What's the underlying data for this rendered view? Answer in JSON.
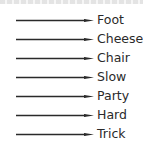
{
  "diagram": {
    "type": "arrow-list",
    "arrow_color": "#2a2a2a",
    "text_color": "#2a2a2a",
    "items": [
      {
        "label": "Foot"
      },
      {
        "label": "Cheese"
      },
      {
        "label": "Chair"
      },
      {
        "label": "Slow"
      },
      {
        "label": "Party"
      },
      {
        "label": "Hard"
      },
      {
        "label": "Trick"
      }
    ]
  }
}
